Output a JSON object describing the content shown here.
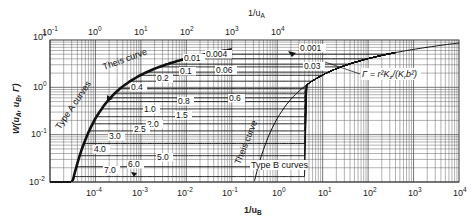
{
  "chart_data": {
    "type": "line",
    "title": "",
    "xlabel_bottom": "1/u_B",
    "xlabel_top": "1/u_A",
    "ylabel": "W(u_A, u_B, Γ)",
    "x_bottom": {
      "scale": "log",
      "range": [
        1e-05,
        10000.0
      ],
      "ticks": [
        "10^-4",
        "10^-3",
        "10^-2",
        "10^-1",
        "10^0",
        "10^1",
        "10^2",
        "10^3",
        "10^4"
      ]
    },
    "x_top": {
      "scale": "log",
      "range": [
        0.1,
        10000.0
      ],
      "ticks": [
        "10^-1",
        "10^0",
        "10^1",
        "10^2",
        "10^3",
        "10^4"
      ]
    },
    "y": {
      "scale": "log",
      "range": [
        0.01,
        10
      ],
      "ticks": [
        "10^-2",
        "10^-1",
        "10^0",
        "10^1"
      ]
    },
    "grid": true,
    "legend": null,
    "annotations": [
      "Theis curve",
      "Theis curve",
      "Type A curves",
      "Type B curves",
      "Γ = r²K_z/(K_r b²)"
    ],
    "series_type_A": [
      {
        "name": "0.001",
        "plateau_W": 5.0
      },
      {
        "name": "0.004",
        "plateau_W": 4.0
      },
      {
        "name": "0.01",
        "plateau_W": 3.1
      },
      {
        "name": "0.03",
        "plateau_W": 2.7
      },
      {
        "name": "0.06",
        "plateau_W": 2.1
      },
      {
        "name": "0.1",
        "plateau_W": 1.8
      },
      {
        "name": "0.2",
        "plateau_W": 1.35
      },
      {
        "name": "0.4",
        "plateau_W": 0.95
      },
      {
        "name": "0.6",
        "plateau_W": 0.75
      },
      {
        "name": "0.8",
        "plateau_W": 0.6
      },
      {
        "name": "1.0",
        "plateau_W": 0.5
      },
      {
        "name": "1.5",
        "plateau_W": 0.35
      },
      {
        "name": "2.0",
        "plateau_W": 0.24
      },
      {
        "name": "2.5",
        "plateau_W": 0.17
      },
      {
        "name": "3.0",
        "plateau_W": 0.12
      },
      {
        "name": "4.0",
        "plateau_W": 0.065
      },
      {
        "name": "5.0",
        "plateau_W": 0.036
      },
      {
        "name": "6.0",
        "plateau_W": 0.021
      },
      {
        "name": "7.0",
        "plateau_W": 0.013
      }
    ]
  },
  "labels": {
    "top_axis_title": "1/u",
    "top_axis_sub": "A",
    "bottom_axis_title": "1/u",
    "bottom_axis_sub": "B",
    "y_axis_title": "W(u",
    "y_axis_a": "A",
    "y_axis_mid": ", u",
    "y_axis_b": "B",
    "y_axis_end": ", Γ)",
    "theis_upper": "Theis curve",
    "theis_lower": "Theis curve",
    "type_a": "Type A curves",
    "type_b": "Type B curves",
    "gamma_def": "Γ = r²K",
    "gamma_z": "z",
    "gamma_mid": "/(K",
    "gamma_r": "r",
    "gamma_end": "b²)"
  },
  "top_ticks": [
    {
      "base": "10",
      "exp": "-1"
    },
    {
      "base": "10",
      "exp": "0"
    },
    {
      "base": "10",
      "exp": "1"
    },
    {
      "base": "10",
      "exp": "2"
    },
    {
      "base": "10",
      "exp": "3"
    },
    {
      "base": "10",
      "exp": "4"
    }
  ],
  "bottom_ticks": [
    {
      "base": "10",
      "exp": "-4"
    },
    {
      "base": "10",
      "exp": "-3"
    },
    {
      "base": "10",
      "exp": "-2"
    },
    {
      "base": "10",
      "exp": "-1"
    },
    {
      "base": "10",
      "exp": "0"
    },
    {
      "base": "10",
      "exp": "1"
    },
    {
      "base": "10",
      "exp": "2"
    },
    {
      "base": "10",
      "exp": "3"
    },
    {
      "base": "10",
      "exp": "4"
    }
  ],
  "y_ticks": [
    {
      "base": "10",
      "exp": "1"
    },
    {
      "base": "10",
      "exp": "0"
    },
    {
      "base": "10",
      "exp": "-1"
    },
    {
      "base": "10",
      "exp": "-2"
    }
  ],
  "curve_labels": {
    "g0001": "0.001",
    "g0004": "0.004",
    "g001": "0.01",
    "g003": "0.03",
    "g006": "0.06",
    "g01": "0.1",
    "g02": "0.2",
    "g04": "0.4",
    "g06": "0.6",
    "g08": "0.8",
    "g10": "1.0",
    "g15": "1.5",
    "g20": "2.0",
    "g25": "2.5",
    "g30": "3.0",
    "g40": "4.0",
    "g50": "5.0",
    "g60": "6.0",
    "g70": "7.0"
  }
}
